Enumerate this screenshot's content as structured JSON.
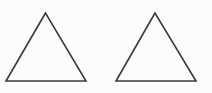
{
  "canvas": {
    "width": 212,
    "height": 93,
    "background_color": "#fcfcfc",
    "description": "Two identical outlined triangles side by side on a plain white background"
  },
  "style": {
    "stroke_color": "#3a3a3c",
    "stroke_width": 1.6,
    "fill": "none"
  },
  "shapes": [
    {
      "name": "triangle-left",
      "type": "triangle",
      "orientation": "apex-up",
      "points": "45.5,13 6,81 86,81",
      "apex": {
        "x": 45.5,
        "y": 13
      },
      "base_left": {
        "x": 6,
        "y": 81
      },
      "base_right": {
        "x": 86,
        "y": 81
      },
      "base_width": 80,
      "height": 68
    },
    {
      "name": "triangle-right",
      "type": "triangle",
      "orientation": "apex-up",
      "points": "155,13 116,81 196,81",
      "apex": {
        "x": 155,
        "y": 13
      },
      "base_left": {
        "x": 116,
        "y": 81
      },
      "base_right": {
        "x": 196,
        "y": 81
      },
      "base_width": 80,
      "height": 68
    }
  ]
}
